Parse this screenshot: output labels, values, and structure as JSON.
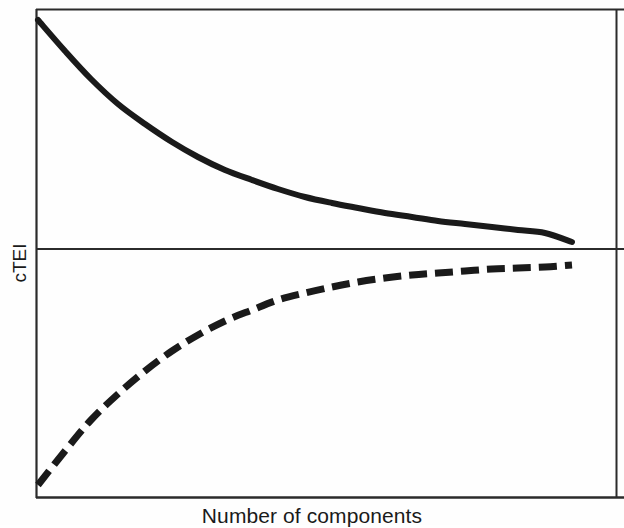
{
  "figure": {
    "background_color": "#fefefe",
    "line_color": "#1a1a1a",
    "frame_color": "#2b2b2b"
  },
  "axes": {
    "y_label": "cTEI",
    "x_label": "Number of components",
    "frame": {
      "left": 36,
      "top": 9,
      "right": 617,
      "bottom": 498
    },
    "divider_y": 249
  },
  "chart_data": {
    "type": "line",
    "title": "",
    "subtitle": "",
    "xlabel": "Number of components",
    "ylabel": "cTEI",
    "grid": false,
    "legend": null,
    "xlim": [
      0,
      1
    ],
    "ylim": [
      0,
      1
    ],
    "axis_ticks": {
      "x": [],
      "y": []
    },
    "series": [
      {
        "name": "decreasing-curve",
        "style": "solid",
        "color": "#1a1a1a",
        "linewidth": 6,
        "description": "Monotonically decreasing exponential decay curve in the upper panel, starting high at the left axis and flattening toward an asymptote just above the mid divider line.",
        "x": [
          0.0,
          0.05,
          0.1,
          0.15,
          0.2,
          0.25,
          0.3,
          0.35,
          0.4,
          0.45,
          0.5,
          0.55,
          0.6,
          0.65,
          0.7,
          0.75,
          0.8,
          0.85,
          0.9,
          0.95,
          1.0
        ],
        "y": [
          1.0,
          0.86,
          0.73,
          0.62,
          0.53,
          0.45,
          0.38,
          0.32,
          0.275,
          0.235,
          0.2,
          0.17,
          0.145,
          0.125,
          0.107,
          0.092,
          0.079,
          0.068,
          0.058,
          0.05,
          0.043
        ],
        "pixel_points": [
          [
            38,
            20
          ],
          [
            65,
            51
          ],
          [
            91,
            79
          ],
          [
            118,
            104
          ],
          [
            145,
            124
          ],
          [
            172,
            142
          ],
          [
            198,
            157
          ],
          [
            225,
            170
          ],
          [
            252,
            180
          ],
          [
            278,
            189
          ],
          [
            305,
            197
          ],
          [
            332,
            203
          ],
          [
            358,
            208
          ],
          [
            385,
            213
          ],
          [
            412,
            217
          ],
          [
            438,
            221
          ],
          [
            465,
            224
          ],
          [
            492,
            227
          ],
          [
            518,
            230
          ],
          [
            545,
            233
          ],
          [
            572,
            242
          ]
        ]
      },
      {
        "name": "increasing-curve",
        "style": "dashed",
        "color": "#1a1a1a",
        "linewidth": 7,
        "dash_length": 18,
        "gap_length": 8,
        "description": "Monotonically increasing saturating exponential curve in the lower panel, rising steeply from the bottom-left and flattening toward an asymptote just below the mid divider line.",
        "x": [
          0.0,
          0.05,
          0.1,
          0.15,
          0.2,
          0.25,
          0.3,
          0.35,
          0.4,
          0.45,
          0.5,
          0.55,
          0.6,
          0.65,
          0.7,
          0.75,
          0.8,
          0.85,
          0.9,
          0.95,
          1.0
        ],
        "y": [
          0.0,
          0.155,
          0.295,
          0.415,
          0.52,
          0.61,
          0.685,
          0.748,
          0.8,
          0.843,
          0.878,
          0.906,
          0.929,
          0.946,
          0.96,
          0.971,
          0.979,
          0.985,
          0.99,
          0.994,
          1.0
        ],
        "pixel_points": [
          [
            38,
            485
          ],
          [
            65,
            451
          ],
          [
            91,
            420
          ],
          [
            118,
            394
          ],
          [
            145,
            371
          ],
          [
            172,
            351
          ],
          [
            198,
            335
          ],
          [
            225,
            321
          ],
          [
            252,
            310
          ],
          [
            278,
            300
          ],
          [
            305,
            293
          ],
          [
            332,
            287
          ],
          [
            358,
            282
          ],
          [
            385,
            278
          ],
          [
            412,
            275
          ],
          [
            438,
            273
          ],
          [
            465,
            271
          ],
          [
            492,
            269
          ],
          [
            518,
            268
          ],
          [
            545,
            267
          ],
          [
            572,
            265
          ]
        ]
      }
    ]
  }
}
